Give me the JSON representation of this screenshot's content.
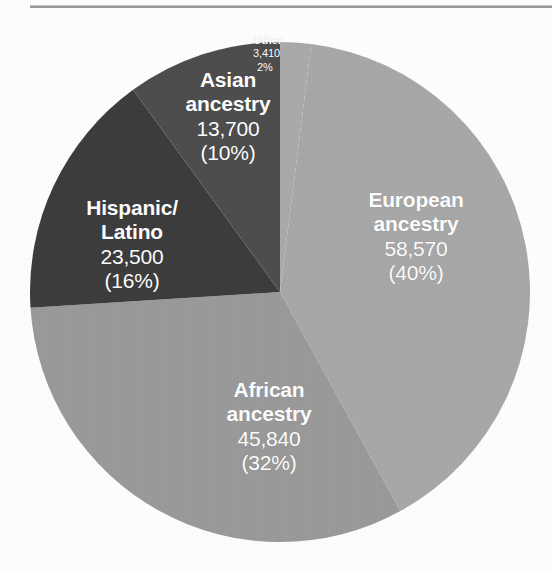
{
  "figure": {
    "background_color": "#ffffff",
    "rule_color": "#9b9b9b",
    "has_top_rule": true
  },
  "chart_data": {
    "type": "pie",
    "title": "",
    "subtitle": "",
    "xlabel": "",
    "ylabel": "",
    "legend_position": "none",
    "grid": false,
    "labels_inside_slices": true,
    "label_text_color": "#ffffff",
    "start_angle_deg": 0,
    "direction": "clockwise",
    "center": [
      280,
      292
    ],
    "radius": 250,
    "total": 144
  },
  "slices": [
    {
      "key": "other",
      "name": "Other",
      "value": "3,410",
      "value_number": 3410,
      "percent": "2%",
      "percent_number": 2,
      "color": "#ababab",
      "label_lines": [
        "Other",
        "3,410",
        "2%"
      ]
    },
    {
      "key": "european",
      "name": "European ancestry",
      "name_line1": "European",
      "name_line2": "ancestry",
      "value": "58,570",
      "value_number": 58570,
      "percent": "(40%)",
      "percent_number": 40,
      "color": "#a9a9a9",
      "label_lines": [
        "European",
        "ancestry",
        "58,570",
        "(40%)"
      ]
    },
    {
      "key": "african",
      "name": "African ancestry",
      "name_line1": "African",
      "name_line2": "ancestry",
      "value": "45,840",
      "value_number": 45840,
      "percent": "(32%)",
      "percent_number": 32,
      "color": "#9b9b9b",
      "label_lines": [
        "African",
        "ancestry",
        "45,840",
        "(32%)"
      ]
    },
    {
      "key": "hispanic",
      "name": "Hispanic/Latino",
      "name_line1": "Hispanic/",
      "name_line2": "Latino",
      "value": "23,500",
      "value_number": 23500,
      "percent": "(16%)",
      "percent_number": 16,
      "color": "#3d3d3d",
      "label_lines": [
        "Hispanic/",
        "Latino",
        "23,500",
        "(16%)"
      ]
    },
    {
      "key": "asian",
      "name": "Asian ancestry",
      "name_line1": "Asian",
      "name_line2": "ancestry",
      "value": "13,700",
      "value_number": 13700,
      "percent": "(10%)",
      "percent_number": 10,
      "color": "#4e4e4e",
      "label_lines": [
        "Asian",
        "ancestry",
        "13,700",
        "(10%)"
      ]
    }
  ]
}
